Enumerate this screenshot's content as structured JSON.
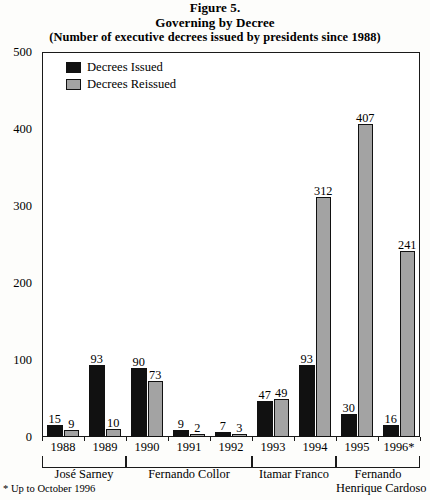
{
  "figure": {
    "title_line1": "Figure 5.",
    "title_line2": "Governing by Decree",
    "title_line3": "(Number of executive decrees issued by presidents since 1988)",
    "footnote": "* Up to October 1996"
  },
  "legend": {
    "position": "top-left-inside",
    "items": [
      {
        "label": "Decrees Issued",
        "color": "#111111",
        "key": "issued"
      },
      {
        "label": "Decrees Reissued",
        "color": "#a3a3a3",
        "key": "reissued"
      }
    ]
  },
  "yaxis": {
    "ticks": [
      "0",
      "100",
      "200",
      "300",
      "400",
      "500"
    ]
  },
  "presidents": [
    {
      "name_line1": "José Sarney",
      "name_line2": "",
      "years": [
        "1988",
        "1989"
      ]
    },
    {
      "name_line1": "Fernando Collor",
      "name_line2": "",
      "years": [
        "1990",
        "1991",
        "1992"
      ]
    },
    {
      "name_line1": "Itamar Franco",
      "name_line2": "",
      "years": [
        "1993",
        "1994"
      ]
    },
    {
      "name_line1": "Fernando",
      "name_line2": "Henrique Cardoso",
      "years": [
        "1995",
        "1996*"
      ]
    }
  ],
  "chart_data": {
    "type": "bar",
    "title": "Governing by Decree",
    "subtitle": "(Number of executive decrees issued by presidents since 1988)",
    "figure_number": "Figure 5.",
    "xlabel": "",
    "ylabel": "",
    "ylim": [
      0,
      500
    ],
    "ytick_interval": 100,
    "grid": false,
    "legend_position": "inside top-left",
    "categories": [
      "1988",
      "1989",
      "1990",
      "1991",
      "1992",
      "1993",
      "1994",
      "1995",
      "1996*"
    ],
    "group_labels": [
      "José Sarney",
      "José Sarney",
      "Fernando Collor",
      "Fernando Collor",
      "Fernando Collor",
      "Itamar Franco",
      "Itamar Franco",
      "Fernando Henrique Cardoso",
      "Fernando Henrique Cardoso"
    ],
    "series": [
      {
        "name": "Decrees Issued",
        "color": "#111111",
        "values": [
          15,
          93,
          90,
          9,
          7,
          47,
          93,
          30,
          16
        ]
      },
      {
        "name": "Decrees Reissued",
        "color": "#a3a3a3",
        "values": [
          9,
          10,
          73,
          2,
          3,
          49,
          312,
          407,
          241
        ]
      }
    ],
    "annotations": [
      "* Up to October 1996"
    ]
  }
}
